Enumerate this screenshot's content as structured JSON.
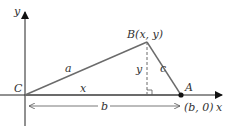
{
  "diagram": {
    "axes": {
      "x_label": "x",
      "y_label": "y"
    },
    "vertices": {
      "C": {
        "label": "C",
        "coords": "origin"
      },
      "B": {
        "label": "B(x, y)"
      },
      "A": {
        "label": "A",
        "coords_label": "(b, 0)"
      }
    },
    "sides": {
      "a": "a",
      "c": "c",
      "x": "x",
      "y": "y",
      "b": "b"
    },
    "colors": {
      "axis": "#111111",
      "triangle": "#6b6b6b",
      "dashed": "#6b6b6b",
      "text": "#333333"
    }
  }
}
